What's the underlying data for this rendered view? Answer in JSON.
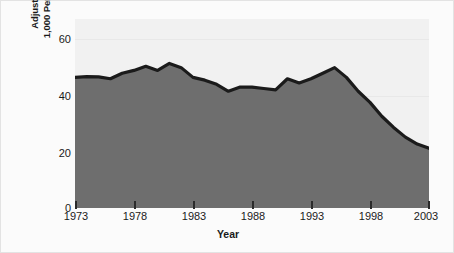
{
  "chart_data": {
    "type": "area",
    "title": "",
    "xlabel": "Year",
    "ylabel_lines": [
      "Adjusted Victimization Rate per",
      "1,000 Persons Age Twelve and Over"
    ],
    "ylabel": "Adjusted Victimization Rate per 1,000 Persons Age Twelve and Over",
    "xlim": [
      1973,
      2003
    ],
    "ylim": [
      0,
      68
    ],
    "yticks": [
      0,
      20,
      40,
      60
    ],
    "ytick_labels": [
      "0",
      "20",
      "40",
      "60"
    ],
    "xticks": [
      1973,
      1978,
      1983,
      1988,
      1993,
      1998,
      2003
    ],
    "xtick_labels": [
      "1973",
      "1978",
      "1983",
      "1988",
      "1993",
      "1998",
      "2003"
    ],
    "grid": true,
    "grid_axis": "y",
    "legend": null,
    "series": [
      {
        "name": "Adjusted victimization rate",
        "x": [
          1973,
          1974,
          1975,
          1976,
          1977,
          1978,
          1979,
          1980,
          1981,
          1982,
          1983,
          1984,
          1985,
          1986,
          1987,
          1988,
          1989,
          1990,
          1991,
          1992,
          1993,
          1994,
          1995,
          1996,
          1997,
          1998,
          1999,
          2000,
          2001,
          2002,
          2003
        ],
        "values": [
          47.0,
          47.3,
          47.2,
          46.5,
          48.5,
          49.5,
          51.0,
          49.5,
          52.0,
          50.5,
          47.0,
          46.0,
          44.5,
          42.0,
          43.5,
          43.5,
          43.0,
          42.5,
          46.5,
          45.0,
          46.5,
          48.5,
          50.5,
          47.0,
          42.0,
          38.0,
          33.0,
          29.0,
          25.5,
          23.0,
          21.5
        ]
      }
    ],
    "colors": {
      "area_fill": "#6e6e6e",
      "line": "#1b1b1b",
      "plot_background": "#f1f1f1",
      "gridline": "#e8e8e8",
      "figure_background": "#fbfbfb",
      "text": "#1a1a1a"
    }
  },
  "axes": {
    "y_title_line1": "Adjusted Victimization Rate per",
    "y_title_line2": "1,000 Persons Age Twelve and Over",
    "x_title": "Year",
    "y_tick_0": "0",
    "y_tick_1": "20",
    "y_tick_2": "40",
    "y_tick_3": "60",
    "x_tick_0": "1973",
    "x_tick_1": "1978",
    "x_tick_2": "1983",
    "x_tick_3": "1988",
    "x_tick_4": "1993",
    "x_tick_5": "1998",
    "x_tick_6": "2003"
  }
}
